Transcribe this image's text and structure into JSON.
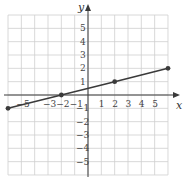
{
  "chart_data": {
    "type": "line",
    "title": "",
    "xlabel": "x",
    "ylabel": "y",
    "xlim": [
      -6,
      6
    ],
    "ylim": [
      -6,
      6
    ],
    "grid": true,
    "x_tick_labels": [
      "-5",
      "-3",
      "-2",
      "-1",
      "1",
      "2",
      "3",
      "4",
      "5"
    ],
    "y_tick_labels": [
      "5",
      "4",
      "3",
      "2",
      "1",
      "-1",
      "-2",
      "-3",
      "-4",
      "-5"
    ],
    "series": [
      {
        "name": "line",
        "points": [
          [
            -6,
            -1
          ],
          [
            -2,
            0
          ],
          [
            2,
            1
          ],
          [
            6,
            2
          ]
        ],
        "color": "#3a3a3a"
      }
    ]
  }
}
